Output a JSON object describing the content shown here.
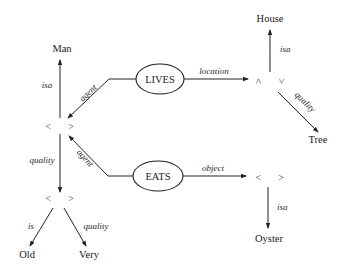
{
  "diagram": {
    "type": "semantic-network",
    "nodes": {
      "man": "Man",
      "house": "House",
      "tree": "Tree",
      "old": "Old",
      "very": "Very",
      "oyster": "Oyster",
      "lives": "LIVES",
      "eats": "EATS",
      "bracket_open": "<",
      "bracket_close": ">"
    },
    "edges": {
      "man_isa": "isa",
      "lives_agent": "agent",
      "lives_location": "location",
      "house_isa": "isa",
      "tree_quality": "quality",
      "entity_quality": "quality",
      "eats_agent": "agent",
      "eats_object": "object",
      "oyster_isa": "isa",
      "old_is": "is",
      "very_quality": "quality"
    },
    "colors": {
      "ink": "#222222",
      "background": "#ffffff"
    }
  }
}
